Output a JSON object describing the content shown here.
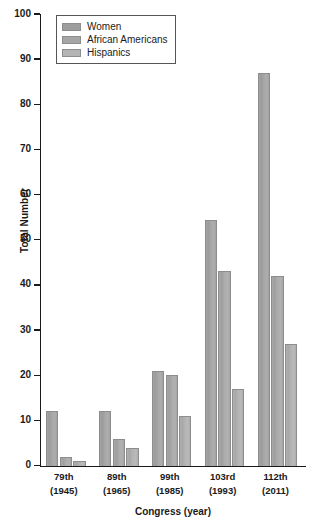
{
  "chart_data": {
    "type": "bar",
    "title": "",
    "subtitle": "",
    "xlabel": "Congress (year)",
    "ylabel": "Total Number",
    "ylim": [
      0,
      100
    ],
    "y_ticks": [
      0,
      10,
      20,
      30,
      40,
      50,
      60,
      70,
      80,
      90,
      100
    ],
    "grid": false,
    "legend_position": "top-left",
    "categories": [
      "79th\n(1945)",
      "89th\n(1965)",
      "99th\n(1985)",
      "103rd\n(1993)",
      "112th\n(2011)"
    ],
    "category_labels": [
      {
        "congress": "79th",
        "year": "(1945)"
      },
      {
        "congress": "89th",
        "year": "(1965)"
      },
      {
        "congress": "99th",
        "year": "(1985)"
      },
      {
        "congress": "103rd",
        "year": "(1993)"
      },
      {
        "congress": "112th",
        "year": "(2011)"
      }
    ],
    "series": [
      {
        "name": "Women",
        "color": "#9d9d9d",
        "values": [
          12,
          12,
          21,
          54.5,
          87
        ]
      },
      {
        "name": "African Americans",
        "color": "#a6a6a6",
        "values": [
          2,
          6,
          20,
          43,
          42
        ]
      },
      {
        "name": "Hispanics",
        "color": "#b4b4b4",
        "values": [
          1,
          4,
          11,
          17,
          27
        ]
      }
    ]
  },
  "legend": {
    "items": [
      {
        "label": "Women"
      },
      {
        "label": "African Americans"
      },
      {
        "label": "Hispanics"
      }
    ]
  },
  "axes": {
    "y_title": "Total Number",
    "x_title": "Congress (year)"
  }
}
